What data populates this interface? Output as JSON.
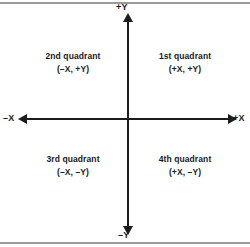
{
  "figure": {
    "background_color": "#ffffff",
    "ink_color": "#1c1c1c",
    "rule_color": "#9a9a9a"
  },
  "axes": {
    "vertical": {
      "positive_label": "+Y",
      "negative_label": "–Y"
    },
    "horizontal": {
      "positive_label": "+X",
      "negative_label": "–X"
    }
  },
  "quadrants": [
    {
      "id": "first",
      "name": "1st quadrant",
      "signs": "(+X, +Y)",
      "x_sign": "+",
      "y_sign": "+"
    },
    {
      "id": "second",
      "name": "2nd quadrant",
      "signs": "(–X, +Y)",
      "x_sign": "–",
      "y_sign": "+"
    },
    {
      "id": "third",
      "name": "3rd quadrant",
      "signs": "(–X, –Y)",
      "x_sign": "–",
      "y_sign": "–"
    },
    {
      "id": "fourth",
      "name": "4th quadrant",
      "signs": "(+X, –Y)",
      "x_sign": "+",
      "y_sign": "–"
    }
  ],
  "chart_data": {
    "type": "scatter",
    "title": "",
    "xlabel": "X",
    "ylabel": "Y",
    "xlim": [
      -1,
      1
    ],
    "ylim": [
      -1,
      1
    ],
    "grid": false,
    "legend": null,
    "series": [],
    "annotations": [
      {
        "text": "1st quadrant (+X, +Y)",
        "x": 0.5,
        "y": 0.5
      },
      {
        "text": "2nd quadrant (–X, +Y)",
        "x": -0.5,
        "y": 0.5
      },
      {
        "text": "3rd quadrant (–X, –Y)",
        "x": -0.5,
        "y": -0.5
      },
      {
        "text": "4th quadrant (+X, –Y)",
        "x": 0.5,
        "y": -0.5
      },
      {
        "text": "+Y",
        "x": 0,
        "y": 1
      },
      {
        "text": "–Y",
        "x": 0,
        "y": -1
      },
      {
        "text": "+X",
        "x": 1,
        "y": 0
      },
      {
        "text": "–X",
        "x": -1,
        "y": 0
      }
    ]
  }
}
